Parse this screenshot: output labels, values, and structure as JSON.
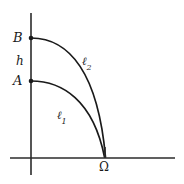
{
  "figure": {
    "type": "geometric-diagram",
    "background_color": "#ffffff",
    "stroke_color": "#1a1a1a",
    "label_color": "#1a1a1a",
    "axes": {
      "vertical": {
        "x": 31,
        "y_top": 13,
        "y_bottom": 175
      },
      "horizontal": {
        "y": 158,
        "x_left": 10,
        "x_right": 175
      }
    },
    "points": [
      {
        "id": "B",
        "label": "B",
        "x": 31,
        "y": 38
      },
      {
        "id": "A",
        "label": "A",
        "x": 31,
        "y": 81
      },
      {
        "id": "Omega",
        "label": "Ω",
        "x": 105,
        "y": 158
      }
    ],
    "segment": {
      "id": "h",
      "label": "h",
      "from": "A",
      "to": "B"
    },
    "curves": [
      {
        "id": "l1",
        "label": "ℓ",
        "subscript": "1",
        "from": "A",
        "to": "Omega",
        "path": "M 31 81 C 62 81 93 100 104.5 157"
      },
      {
        "id": "l2",
        "label": "ℓ",
        "subscript": "2",
        "from": "B",
        "to": "Omega",
        "path": "M 31 38 C 70 38 98 74 105.5 157"
      }
    ],
    "labels": {
      "B": "B",
      "A": "A",
      "h": "h",
      "l1": "ℓ",
      "l1_sub": "1",
      "l2": "ℓ",
      "l2_sub": "2",
      "omega": "Ω"
    }
  }
}
